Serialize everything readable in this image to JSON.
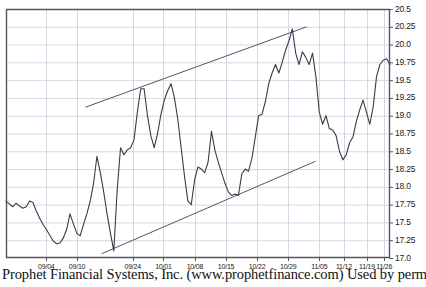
{
  "caption": "Prophet Financial Systems, Inc. (www.prophetfinance.com) Used by permission.",
  "colors": {
    "price_line": "#3c3c46",
    "trendline": "#555561",
    "grid": "#c8cfdd",
    "axis": "#55555f",
    "background": "#ffffff",
    "text": "#1a1a1a"
  },
  "chart_data": {
    "type": "line",
    "title": "",
    "subtitle": "",
    "xlabel": "",
    "ylabel": "",
    "grid": true,
    "legend": "none",
    "y_axis_position": "right",
    "ylim": [
      17.0,
      20.5
    ],
    "yticks": [
      17.0,
      17.25,
      17.5,
      17.75,
      18.0,
      18.25,
      18.5,
      18.75,
      19.0,
      19.25,
      19.5,
      19.75,
      20.0,
      20.25,
      20.5
    ],
    "ytick_labels": [
      "17.0",
      "17.25",
      "17.5",
      "17.75",
      "18.0",
      "18.25",
      "18.5",
      "18.75",
      "19.0",
      "19.25",
      "19.5",
      "19.75",
      "20.0",
      "20.25",
      "20.5"
    ],
    "xtick_labels": [
      "09/04",
      "09/10",
      "09/24",
      "10/01",
      "10/08",
      "10/15",
      "10/22",
      "10/29",
      "11/05",
      "11/12",
      "11/19",
      "11/26"
    ],
    "xtick_positions": [
      0.105,
      0.185,
      0.33,
      0.41,
      0.492,
      0.573,
      0.654,
      0.735,
      0.816,
      0.88,
      0.94,
      0.985
    ],
    "xlim": [
      0,
      100
    ],
    "series": [
      {
        "name": "price",
        "x": [
          0,
          1,
          2,
          3,
          4,
          5,
          6,
          7,
          8,
          9,
          10,
          11,
          12,
          13,
          14,
          15,
          16,
          17,
          18,
          19,
          20,
          21,
          22,
          23,
          24,
          25,
          26,
          27,
          28,
          29,
          30,
          31,
          32,
          33,
          34,
          35,
          36,
          37,
          38,
          39,
          40,
          41,
          42,
          43,
          44,
          45,
          46,
          47,
          48,
          49,
          50,
          51,
          52,
          53,
          54,
          55,
          56,
          57,
          58,
          59,
          60,
          61,
          62,
          63,
          64,
          65,
          66,
          67,
          68,
          69,
          70,
          71,
          72,
          73,
          74,
          75,
          76,
          77,
          78,
          79,
          80,
          81,
          82,
          83,
          84,
          85,
          86,
          87,
          88,
          89,
          90,
          91,
          92,
          93,
          94,
          95,
          96,
          97,
          98,
          99,
          100
        ],
        "values": [
          17.8,
          17.76,
          17.72,
          17.77,
          17.73,
          17.7,
          17.72,
          17.8,
          17.78,
          17.66,
          17.56,
          17.47,
          17.4,
          17.32,
          17.24,
          17.2,
          17.21,
          17.28,
          17.4,
          17.62,
          17.48,
          17.35,
          17.31,
          17.47,
          17.62,
          17.8,
          18.05,
          18.43,
          18.2,
          17.93,
          17.62,
          17.35,
          17.1,
          17.95,
          18.55,
          18.45,
          18.52,
          18.55,
          18.66,
          19.05,
          19.38,
          19.38,
          19.0,
          18.72,
          18.55,
          18.75,
          19.02,
          19.22,
          19.35,
          19.45,
          19.25,
          18.95,
          18.55,
          18.15,
          17.8,
          17.75,
          18.1,
          18.28,
          18.25,
          18.2,
          18.35,
          18.78,
          18.52,
          18.35,
          18.2,
          18.05,
          17.93,
          17.88,
          17.9,
          17.88,
          18.18,
          18.25,
          18.22,
          18.4,
          18.7,
          19.0,
          19.02,
          19.2,
          19.45,
          19.6,
          19.72,
          19.6,
          19.75,
          19.92,
          20.05,
          20.22,
          19.88,
          19.72,
          19.9,
          19.82,
          19.72,
          19.88,
          19.55,
          19.05,
          18.88,
          19.0,
          18.82,
          18.8,
          18.72,
          18.5,
          18.38
        ]
      }
    ],
    "series_extra": {
      "name": "price_tail",
      "values": [
        18.38,
        18.45,
        18.62,
        18.7,
        18.92,
        19.08,
        19.22,
        19.05,
        18.88,
        19.12,
        19.55,
        19.72,
        19.78,
        19.8,
        19.72
      ]
    },
    "annotations": [
      {
        "name": "upper-trendline",
        "type": "trendline",
        "x_start_pct": 0.207,
        "y_start_value": 19.12,
        "x_end_pct": 0.783,
        "y_end_value": 20.25
      },
      {
        "name": "lower-trendline",
        "type": "trendline",
        "x_start_pct": 0.249,
        "y_start_value": 17.06,
        "x_end_pct": 0.806,
        "y_end_value": 18.36
      }
    ],
    "pattern": "rising wedge"
  }
}
